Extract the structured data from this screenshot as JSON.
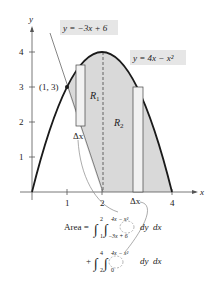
{
  "figure": {
    "axes": {
      "x_label": "x",
      "y_label": "y",
      "x_ticks": [
        "1",
        "2",
        "4"
      ],
      "y_ticks": [
        "1",
        "2",
        "3",
        "4"
      ]
    },
    "curves": {
      "line_label": "y = −3x + 6",
      "parabola_label": "y = 4x − x²"
    },
    "point_label": "(1, 3)",
    "regions": {
      "r1": "R",
      "r1_sub": "1",
      "r2": "R",
      "r2_sub": "2"
    },
    "delta_labels": {
      "left": "Δx",
      "right": "Δx"
    },
    "formula": {
      "line1": {
        "prefix": "Area = ",
        "outer_lower": "1",
        "outer_upper": "2",
        "inner_lower": "−3x + 6",
        "inner_upper": "4x − x²",
        "dy": "dy",
        "dx": "dx"
      },
      "line2": {
        "prefix": "+",
        "outer_lower": "2",
        "outer_upper": "4",
        "inner_lower": "0",
        "inner_upper": "4x − x²",
        "dy": "dy",
        "dx": "dx"
      }
    },
    "colors": {
      "shade": "#d9d9d9",
      "curve": "#1a1a1a",
      "label_bg": "#e6e6e6",
      "rect_fill": "#f2f2f2"
    }
  }
}
